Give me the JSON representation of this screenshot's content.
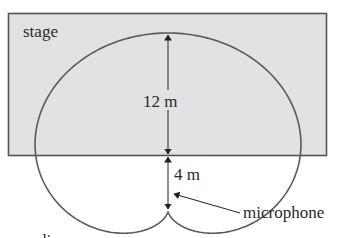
{
  "labels": {
    "stage": "stage",
    "upper_distance": "12 m",
    "lower_distance": "4 m",
    "microphone": "microphone",
    "audience": "audience"
  },
  "colors": {
    "stage_fill": "#e2e2e2",
    "stage_border": "#555555",
    "curve": "#5a5a5a",
    "text": "#2a2a2a",
    "background": "#ffffff"
  },
  "geometry": {
    "stage_distance_from_mic_m": 4,
    "curve_extent_above_stage_m": 12
  }
}
